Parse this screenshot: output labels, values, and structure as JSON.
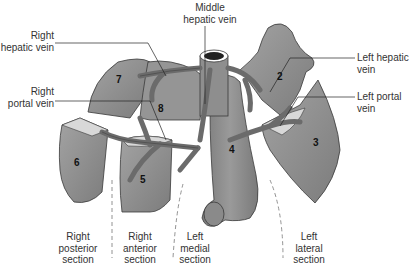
{
  "diagram": {
    "type": "anatomical illustration"
  },
  "labels": {
    "right_hepatic_vein": [
      "Right",
      "hepatic vein"
    ],
    "middle_hepatic_vein": [
      "Middle",
      "hepatic vein"
    ],
    "left_hepatic_vein": [
      "Left hepatic",
      "vein"
    ],
    "right_portal_vein": [
      "Right",
      "portal vein"
    ],
    "left_portal_vein": [
      "Left portal",
      "vein"
    ]
  },
  "segments": {
    "s2": "2",
    "s3": "3",
    "s4": "4",
    "s5": "5",
    "s6": "6",
    "s7": "7",
    "s8": "8"
  },
  "sections": {
    "right_posterior": [
      "Right",
      "posterior",
      "section"
    ],
    "right_anterior": [
      "Right",
      "anterior",
      "section"
    ],
    "left_medial": [
      "Left",
      "medial",
      "section"
    ],
    "left_lateral": [
      "Left",
      "lateral",
      "section"
    ]
  },
  "colors": {
    "tissue": "#8a8a8a",
    "tissue_light": "#a8a8a8",
    "vessel": "#6e6e6e",
    "cut_surface": "#d8d8d8",
    "outline": "#3a3a3a",
    "text": "#333333"
  }
}
